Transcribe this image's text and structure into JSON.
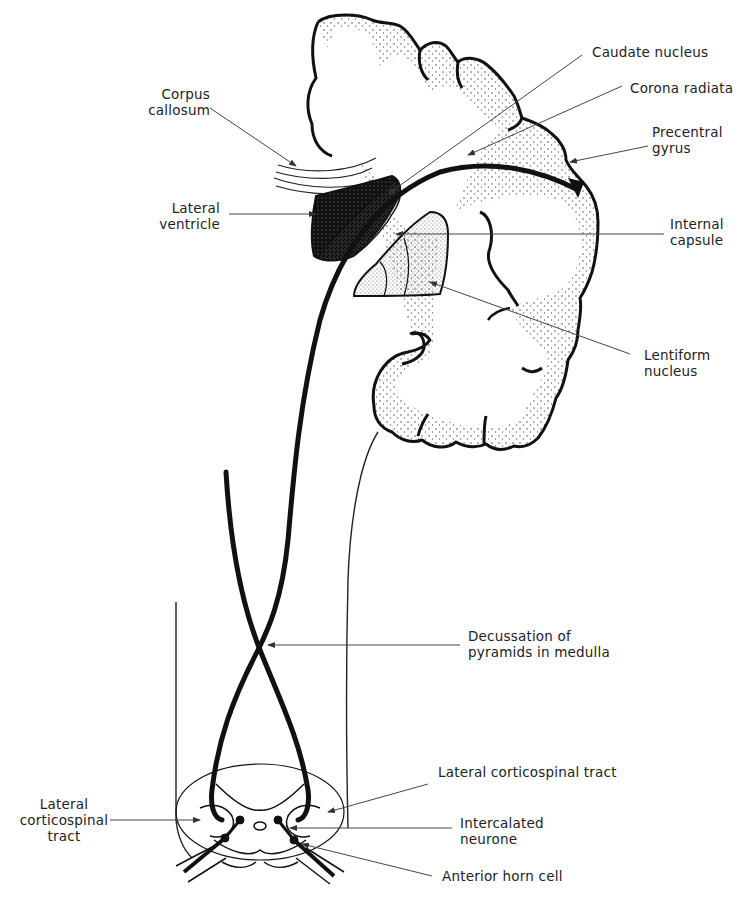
{
  "diagram": {
    "labels": {
      "corpus_callosum": {
        "line1": "Corpus",
        "line2": "callosum"
      },
      "lateral_ventricle": {
        "line1": "Lateral",
        "line2": "ventricle"
      },
      "caudate_nucleus": {
        "line1": "Caudate nucleus"
      },
      "corona_radiata": {
        "line1": "Corona radiata"
      },
      "precentral_gyrus": {
        "line1": "Precentral",
        "line2": "gyrus"
      },
      "internal_capsule": {
        "line1": "Internal",
        "line2": "capsule"
      },
      "lentiform_nucleus": {
        "line1": "Lentiform",
        "line2": "nucleus"
      },
      "decussation": {
        "line1": "Decussation of",
        "line2": "pyramids in medulla"
      },
      "lateral_corticospinal_tract_right": {
        "line1": "Lateral corticospinal tract"
      },
      "lateral_corticospinal_tract_left": {
        "line1": "Lateral",
        "line2": "corticospinal",
        "line3": "tract"
      },
      "intercalated_neurone": {
        "line1": "Intercalated",
        "line2": "neurone"
      },
      "anterior_horn_cell": {
        "line1": "Anterior horn cell"
      }
    },
    "colors": {
      "ink": "#111111",
      "leader": "#444444",
      "stipple": "#555555",
      "background": "#ffffff"
    }
  }
}
